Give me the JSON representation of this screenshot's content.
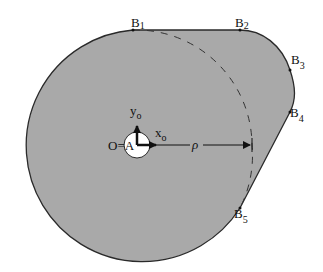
{
  "diagram": {
    "type": "cam-profile",
    "colors": {
      "fill": "#a9a9a9",
      "outline": "#2a2a2a",
      "hole": "#ffffff",
      "background": "#ffffff"
    },
    "points": [
      {
        "letter": "B",
        "sub": "1"
      },
      {
        "letter": "B",
        "sub": "2"
      },
      {
        "letter": "B",
        "sub": "3"
      },
      {
        "letter": "B",
        "sub": "4"
      },
      {
        "letter": "B",
        "sub": "5"
      }
    ],
    "origin_label": "O=A",
    "axes": {
      "x": {
        "letter": "x",
        "sub": "o"
      },
      "y": {
        "letter": "y",
        "sub": "o"
      }
    },
    "radius_label": "ρ"
  }
}
